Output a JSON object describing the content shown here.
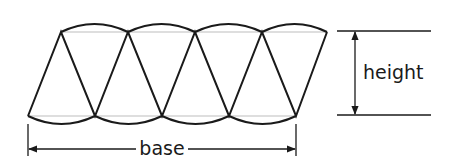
{
  "diagram": {
    "sector_count": 8,
    "labels": {
      "base": "base",
      "height": "height"
    },
    "colors": {
      "stroke": "#1a1a1a",
      "chord": "#bdbdbd",
      "background": "#ffffff"
    }
  }
}
